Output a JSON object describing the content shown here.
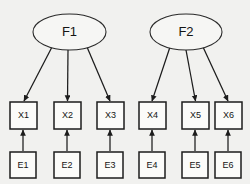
{
  "diagram": {
    "background_color": "#f1f1ef",
    "line_color": "#1c1c1c",
    "node_fill": "#fbfbf9",
    "latent_factors": [
      {
        "id": "F1",
        "label": "F1",
        "cx": 69.5,
        "cy": 32,
        "rx": 36.5,
        "ry": 18
      },
      {
        "id": "F2",
        "label": "F2",
        "cx": 186,
        "cy": 32,
        "rx": 36,
        "ry": 18
      }
    ],
    "observed_variables": [
      {
        "id": "X1",
        "label": "X1",
        "x": 10,
        "y": 102,
        "w": 27,
        "h": 27
      },
      {
        "id": "X2",
        "label": "X2",
        "x": 54,
        "y": 102,
        "w": 27,
        "h": 27
      },
      {
        "id": "X3",
        "label": "X3",
        "x": 97,
        "y": 102,
        "w": 27,
        "h": 27
      },
      {
        "id": "X4",
        "label": "X4",
        "x": 139,
        "y": 102,
        "w": 27,
        "h": 27
      },
      {
        "id": "X5",
        "label": "X5",
        "x": 182,
        "y": 102,
        "w": 27,
        "h": 27
      },
      {
        "id": "X6",
        "label": "X6",
        "x": 215,
        "y": 102,
        "w": 27,
        "h": 27
      }
    ],
    "error_terms": [
      {
        "id": "E1",
        "label": "E1",
        "x": 10,
        "y": 152,
        "w": 26,
        "h": 26
      },
      {
        "id": "E2",
        "label": "E2",
        "x": 54,
        "y": 152,
        "w": 26,
        "h": 26
      },
      {
        "id": "E3",
        "label": "E3",
        "x": 97,
        "y": 152,
        "w": 26,
        "h": 26
      },
      {
        "id": "E4",
        "label": "E4",
        "x": 139,
        "y": 152,
        "w": 26,
        "h": 26
      },
      {
        "id": "E5",
        "label": "E5",
        "x": 182,
        "y": 152,
        "w": 26,
        "h": 26
      },
      {
        "id": "E6",
        "label": "E6",
        "x": 215,
        "y": 152,
        "w": 26,
        "h": 26
      }
    ],
    "loading_paths": [
      {
        "from": "F1",
        "to": "X1",
        "x1": 52,
        "y1": 47,
        "x2": 24,
        "y2": 101
      },
      {
        "from": "F1",
        "to": "X2",
        "x1": 68,
        "y1": 50,
        "x2": 67.5,
        "y2": 101
      },
      {
        "from": "F1",
        "to": "X3",
        "x1": 87,
        "y1": 47,
        "x2": 110,
        "y2": 101
      },
      {
        "from": "F2",
        "to": "X4",
        "x1": 170,
        "y1": 47,
        "x2": 152,
        "y2": 101
      },
      {
        "from": "F2",
        "to": "X5",
        "x1": 186,
        "y1": 50,
        "x2": 195.5,
        "y2": 101
      },
      {
        "from": "F2",
        "to": "X6",
        "x1": 203,
        "y1": 47,
        "x2": 228,
        "y2": 101
      }
    ],
    "error_paths": [
      {
        "from": "E1",
        "to": "X1",
        "x1": 23,
        "y1": 151,
        "x2": 23,
        "y2": 130
      },
      {
        "from": "E2",
        "to": "X2",
        "x1": 67,
        "y1": 151,
        "x2": 67,
        "y2": 130
      },
      {
        "from": "E3",
        "to": "X3",
        "x1": 110,
        "y1": 151,
        "x2": 110,
        "y2": 130
      },
      {
        "from": "E4",
        "to": "X4",
        "x1": 152,
        "y1": 151,
        "x2": 152,
        "y2": 130
      },
      {
        "from": "E5",
        "to": "X5",
        "x1": 195,
        "y1": 151,
        "x2": 195,
        "y2": 130
      },
      {
        "from": "E6",
        "to": "X6",
        "x1": 228,
        "y1": 151,
        "x2": 228,
        "y2": 130
      }
    ]
  }
}
